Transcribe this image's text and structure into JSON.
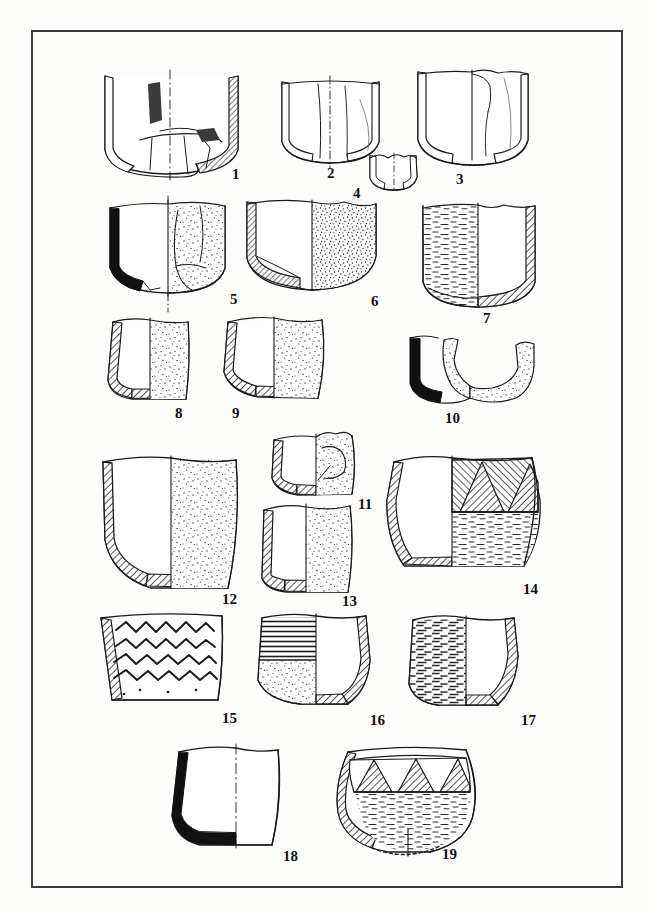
{
  "plate": {
    "caption": "",
    "frame": {
      "x": 32,
      "y": 31,
      "width": 590,
      "height": 856,
      "stroke": "#3b3b3b",
      "stroke_width": 2
    },
    "background": "#fdfdfc",
    "ink": "#1a1a1a",
    "convention": "Archaeological pottery profile plate: left half = cut section (hatched or solid black), right half = exterior surface (stippled / decorated)."
  },
  "vessels": [
    {
      "id": 1,
      "label": "1",
      "label_x": 232,
      "label_y": 167,
      "description": "Deep hemispherical bowl, heavily fragmented, reconstructed base sherds with dark inclusions",
      "section_fill": "hatch",
      "surface_fill": "plain",
      "centerline": true
    },
    {
      "id": 2,
      "label": "2",
      "label_x": 327,
      "label_y": 166,
      "description": "Rounded open bowl, thin-walled, sherd breaks drawn on surface",
      "section_fill": "line",
      "surface_fill": "plain",
      "centerline": true
    },
    {
      "id": 3,
      "label": "3",
      "label_x": 456,
      "label_y": 172,
      "description": "Wide straight-sided bowl with rounded base, eroded rim on right",
      "section_fill": "line",
      "surface_fill": "plain",
      "centerline": false
    },
    {
      "id": 4,
      "label": "4",
      "label_x": 353,
      "label_y": 186,
      "description": "Small base sherd / miniature cup fragment",
      "section_fill": "line",
      "surface_fill": "plain",
      "centerline": true
    },
    {
      "id": 5,
      "label": "5",
      "label_x": 230,
      "label_y": 292,
      "description": "Bowl with solid black section wall, refitted sherds on exterior, stippled surface",
      "section_fill": "solid",
      "surface_fill": "stipple",
      "centerline": true
    },
    {
      "id": 6,
      "label": "6",
      "label_x": 371,
      "label_y": 294,
      "description": "Deep rounded bowl, finely hatched section, densely stippled exterior",
      "section_fill": "hatch",
      "surface_fill": "stipple",
      "centerline": false
    },
    {
      "id": 7,
      "label": "7",
      "label_x": 483,
      "label_y": 311,
      "description": "Mirrored drawing: textured surface at left, hatched section at right; flat base",
      "section_fill": "hatch",
      "surface_fill": "streak",
      "centerline": false,
      "mirrored": true
    },
    {
      "id": 8,
      "label": "8",
      "label_x": 175,
      "label_y": 406,
      "description": "Small carinated cup, hatched section, stippled exterior, flat base",
      "section_fill": "hatch",
      "surface_fill": "stipple",
      "centerline": false
    },
    {
      "id": 9,
      "label": "9",
      "label_x": 232,
      "label_y": 406,
      "description": "Rounded bowl with everted rim, hatched section, stippled exterior",
      "section_fill": "hatch",
      "surface_fill": "stipple",
      "centerline": false
    },
    {
      "id": 10,
      "label": "10",
      "label_x": 445,
      "label_y": 411,
      "description": "Fragmentary angular sherd; solid black profile at left, two stippled body sherds",
      "section_fill": "solid",
      "surface_fill": "stipple",
      "centerline": false
    },
    {
      "id": 11,
      "label": "11",
      "label_x": 358,
      "label_y": 497,
      "description": "Low bowl fragment, hatched section, sherd breaks on stippled exterior",
      "section_fill": "hatch",
      "surface_fill": "stipple",
      "centerline": false
    },
    {
      "id": 12,
      "label": "12",
      "label_x": 222,
      "label_y": 592,
      "description": "Large deep bucket-shaped jar, hatched section, evenly stippled exterior",
      "section_fill": "hatch",
      "surface_fill": "stipple",
      "centerline": false
    },
    {
      "id": 13,
      "label": "13",
      "label_x": 342,
      "label_y": 594,
      "description": "Small straight-sided beaker, hatched section, stippled exterior",
      "section_fill": "hatch",
      "surface_fill": "stipple",
      "centerline": false
    },
    {
      "id": 14,
      "label": "14",
      "label_x": 523,
      "label_y": 582,
      "description": "Biconical jar with zone of opposed hatched triangles below the rim, streaked lower body",
      "section_fill": "hatch",
      "surface_fill": "streak",
      "decoration": "hatched-triangle-band",
      "centerline": false
    },
    {
      "id": 15,
      "label": "15",
      "label_x": 222,
      "label_y": 711,
      "description": "Open bowl decorated with four horizontal wavy lines below the rim",
      "section_fill": "hatch",
      "surface_fill": "plain",
      "decoration": "wavy-lines",
      "centerline": false
    },
    {
      "id": 16,
      "label": "16",
      "label_x": 370,
      "label_y": 713,
      "description": "Mirrored: horizontally lined upper zone and stippled lower body at left, hatched section at right",
      "section_fill": "hatch",
      "surface_fill": "horizontal-lines",
      "decoration": "horizontal-lines",
      "centerline": false,
      "mirrored": true
    },
    {
      "id": 17,
      "label": "17",
      "label_x": 521,
      "label_y": 713,
      "description": "Mirrored: streaked/burnished surface at left, hatched section at right",
      "section_fill": "hatch",
      "surface_fill": "streak",
      "centerline": false,
      "mirrored": true
    },
    {
      "id": 18,
      "label": "18",
      "label_x": 283,
      "label_y": 849,
      "description": "Rounded cup with solid black section wall and dash-dot centre line",
      "section_fill": "solid",
      "surface_fill": "plain",
      "centerline": true
    },
    {
      "id": 19,
      "label": "19",
      "label_x": 442,
      "label_y": 847,
      "description": "Globular jar with band of alternating hatched triangles at the rim; reconstructed base shown dotted",
      "section_fill": "hatch",
      "surface_fill": "streak",
      "decoration": "hatched-triangle-band",
      "centerline": true,
      "reconstructed_base": true
    }
  ]
}
